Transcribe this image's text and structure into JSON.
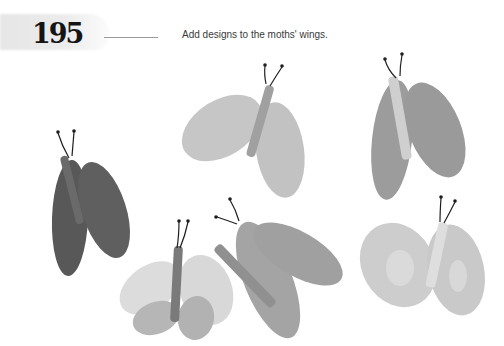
{
  "page": {
    "number": "195",
    "instruction": "Add designs to the moths' wings."
  },
  "illustration": {
    "subject": "moths",
    "count": 7,
    "palette": {
      "light": "#c8c8c8",
      "mid": "#a2a2a2",
      "dark": "#5a5a5a",
      "antenna": "#1e1e1e"
    }
  }
}
